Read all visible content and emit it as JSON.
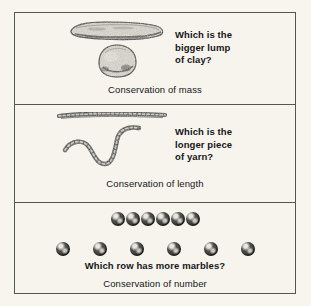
{
  "figure": {
    "paper_color": "#f6f4ec",
    "ink_color": "#15161a",
    "frame_color": "#55564e"
  },
  "panels": [
    {
      "id": "conservation-of-mass",
      "question": "Which is the\nbigger lump\nof clay?",
      "caption": "Conservation of mass",
      "illustration": {
        "name": "clay-lumps-illustration",
        "objects": [
          {
            "name": "clay-log",
            "shape": "elongated-rolled-log",
            "orientation": "horizontal"
          },
          {
            "name": "clay-ball",
            "shape": "round-ball",
            "orientation": "none"
          }
        ]
      }
    },
    {
      "id": "conservation-of-length",
      "question": "Which is the\nlonger piece\nof yarn?",
      "caption": "Conservation of length",
      "illustration": {
        "name": "yarn-pieces-illustration",
        "objects": [
          {
            "name": "yarn-straight",
            "shape": "straight-strand",
            "orientation": "horizontal"
          },
          {
            "name": "yarn-curved",
            "shape": "wavy-curved-strand",
            "orientation": "none"
          }
        ]
      }
    },
    {
      "id": "conservation-of-number",
      "question": "Which row has more marbles?",
      "caption": "Conservation of number",
      "illustration": {
        "name": "marble-rows-illustration",
        "rows": [
          {
            "name": "marble-row-close",
            "count": 6,
            "spacing": "close"
          },
          {
            "name": "marble-row-spread",
            "count": 6,
            "spacing": "spread"
          }
        ]
      }
    }
  ]
}
